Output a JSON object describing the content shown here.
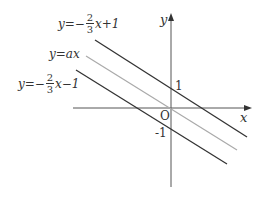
{
  "figure": {
    "axes": {
      "x_label": "x",
      "y_label": "y",
      "origin_label": "O"
    },
    "ticks": {
      "y_pos": "1",
      "y_neg": "-1"
    },
    "lines": [
      {
        "id": "top",
        "label_pre": "y=−",
        "frac_num": "2",
        "frac_den": "3",
        "label_post": "x+1",
        "color": "#333333"
      },
      {
        "id": "middle",
        "label": "y=ax",
        "color": "#aaaaaa"
      },
      {
        "id": "bottom",
        "label_pre": "y=−",
        "frac_num": "2",
        "frac_den": "3",
        "label_post": "x−1",
        "color": "#333333"
      }
    ]
  }
}
